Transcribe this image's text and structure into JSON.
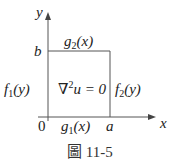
{
  "diagram": {
    "axes": {
      "x_label": "x",
      "y_label": "y",
      "origin": "0"
    },
    "corners": {
      "a": "a",
      "b": "b"
    },
    "boundaries": {
      "top": {
        "name": "g",
        "sub": "2",
        "arg": "(x)"
      },
      "bottom": {
        "name": "g",
        "sub": "1",
        "arg": "(x)"
      },
      "left": {
        "name": "f",
        "sub": "1",
        "arg": "(y)"
      },
      "right": {
        "name": "f",
        "sub": "2",
        "arg": "(y)"
      }
    },
    "equation": {
      "nabla": "∇",
      "sup": "2",
      "rest": "u = 0"
    },
    "caption": "圖 11-5",
    "line_color": "#555555"
  }
}
